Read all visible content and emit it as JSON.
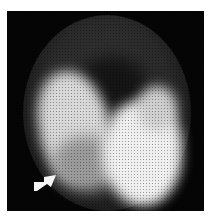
{
  "image": {
    "description": "Grayscale nuclear medicine scintigraphy scan showing bright uptake regions on a dark circular field",
    "annotation": "arrow-icon",
    "colors": {
      "background": "#050505",
      "uptake": "#f0f0f0",
      "page": "#ffffff"
    }
  }
}
